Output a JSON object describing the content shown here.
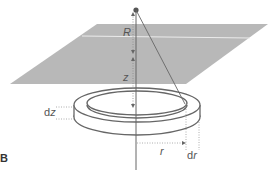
{
  "diagram": {
    "panel_label": "B",
    "labels": {
      "R": "R",
      "z": "z",
      "dz_d": "d",
      "dz_z": "z",
      "r": "r",
      "dr_d": "d",
      "dr_r": "r"
    },
    "colors": {
      "plane": "#b8b8b8",
      "stroke": "#555555",
      "dot": "#555555"
    }
  }
}
